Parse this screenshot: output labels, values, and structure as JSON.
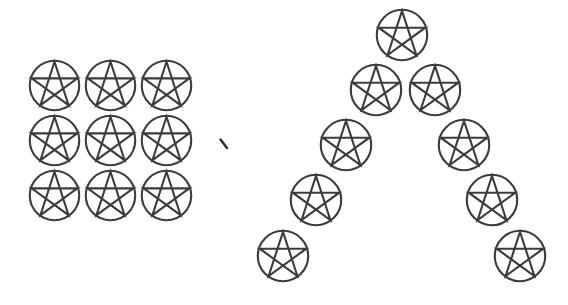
{
  "page": {
    "background_color": "#ffffff",
    "width": 568,
    "height": 305
  },
  "style": {
    "stroke_color": "#3c3c3c",
    "stroke_width": 2.1,
    "fill": "none",
    "tick_color": "#2b2b2b"
  },
  "symbol": {
    "name": "pentacle",
    "description": "five-pointed star (pentagram) inscribed in a circle",
    "points": 5,
    "diameter": 52
  },
  "groups": [
    {
      "name": "left-square-grid",
      "arrangement": "3x3 square grid",
      "count": 9,
      "rows": 3,
      "columns": 3,
      "items": [
        {
          "label": "pentacle-r1c1",
          "x": 29,
          "y": 60,
          "size": 51
        },
        {
          "label": "pentacle-r1c2",
          "x": 85,
          "y": 60,
          "size": 51
        },
        {
          "label": "pentacle-r1c3",
          "x": 141,
          "y": 60,
          "size": 51
        },
        {
          "label": "pentacle-r2c1",
          "x": 29,
          "y": 115,
          "size": 51
        },
        {
          "label": "pentacle-r2c2",
          "x": 85,
          "y": 115,
          "size": 51
        },
        {
          "label": "pentacle-r2c3",
          "x": 141,
          "y": 115,
          "size": 51
        },
        {
          "label": "pentacle-r3c1",
          "x": 29,
          "y": 170,
          "size": 51
        },
        {
          "label": "pentacle-r3c2",
          "x": 85,
          "y": 170,
          "size": 51
        },
        {
          "label": "pentacle-r3c3",
          "x": 141,
          "y": 170,
          "size": 51
        }
      ]
    },
    {
      "name": "right-chevron",
      "arrangement": "triangular chevron (lambda / inverted V)",
      "count": 9,
      "rows": 5,
      "items": [
        {
          "label": "pentacle-apex",
          "x": 376,
          "y": 9,
          "size": 52
        },
        {
          "label": "pentacle-row2-left",
          "x": 350,
          "y": 64,
          "size": 52
        },
        {
          "label": "pentacle-row2-right",
          "x": 409,
          "y": 64,
          "size": 52
        },
        {
          "label": "pentacle-row3-left",
          "x": 320,
          "y": 119,
          "size": 52
        },
        {
          "label": "pentacle-row3-right",
          "x": 438,
          "y": 119,
          "size": 52
        },
        {
          "label": "pentacle-row4-left",
          "x": 290,
          "y": 174,
          "size": 52
        },
        {
          "label": "pentacle-row4-right",
          "x": 466,
          "y": 174,
          "size": 52
        },
        {
          "label": "pentacle-row5-left",
          "x": 257,
          "y": 230,
          "size": 52
        },
        {
          "label": "pentacle-row5-right",
          "x": 494,
          "y": 230,
          "size": 52
        }
      ]
    }
  ],
  "marks": [
    {
      "name": "comma-tick-mark",
      "shape": "short diagonal stroke",
      "x": 220,
      "y": 139,
      "width": 8,
      "height": 10
    }
  ]
}
